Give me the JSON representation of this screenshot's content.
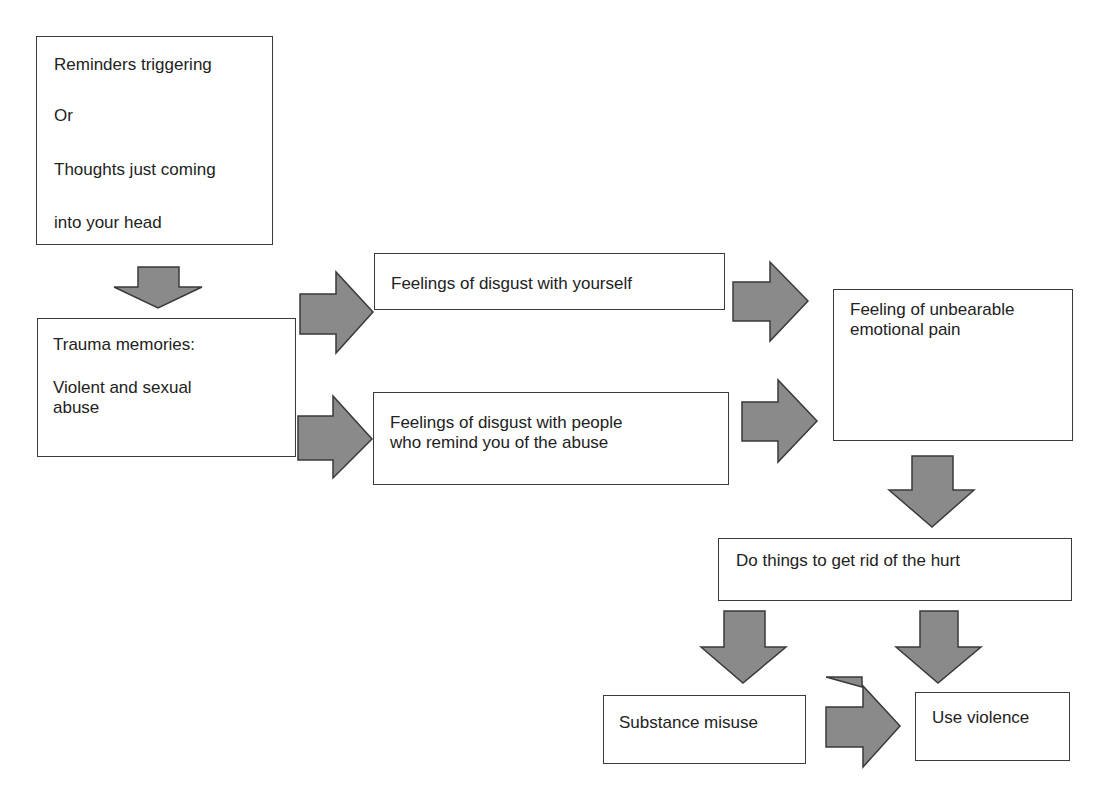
{
  "diagram": {
    "type": "flowchart",
    "colors": {
      "arrow_fill": "#8a8a8a",
      "arrow_stroke": "#3a3a3a",
      "box_border": "#3a3a3a",
      "text": "#222222",
      "background": "#ffffff"
    },
    "nodes": {
      "reminders": {
        "lines": [
          "Reminders triggering",
          "Or",
          "Thoughts just coming",
          "into your head"
        ]
      },
      "trauma": {
        "lines": [
          "Trauma memories:",
          "Violent and sexual",
          "abuse"
        ]
      },
      "disgust_self": {
        "lines": [
          "Feelings of disgust with yourself"
        ]
      },
      "disgust_people": {
        "lines": [
          "Feelings of disgust with people",
          "who remind you of the abuse"
        ]
      },
      "pain": {
        "lines": [
          "Feeling of unbearable",
          "emotional pain"
        ]
      },
      "get_rid": {
        "lines": [
          "Do things to get rid of the hurt"
        ]
      },
      "substance": {
        "lines": [
          "Substance misuse"
        ]
      },
      "violence": {
        "lines": [
          "Use violence"
        ]
      }
    },
    "edges": [
      {
        "from": "reminders",
        "to": "trauma",
        "direction": "down"
      },
      {
        "from": "trauma",
        "to": "disgust_self",
        "direction": "right"
      },
      {
        "from": "trauma",
        "to": "disgust_people",
        "direction": "right"
      },
      {
        "from": "disgust_self",
        "to": "pain",
        "direction": "right"
      },
      {
        "from": "disgust_people",
        "to": "pain",
        "direction": "right"
      },
      {
        "from": "pain",
        "to": "get_rid",
        "direction": "down"
      },
      {
        "from": "get_rid",
        "to": "substance",
        "direction": "down"
      },
      {
        "from": "get_rid",
        "to": "violence",
        "direction": "down"
      },
      {
        "from": "substance",
        "to": "violence",
        "direction": "right"
      }
    ]
  }
}
